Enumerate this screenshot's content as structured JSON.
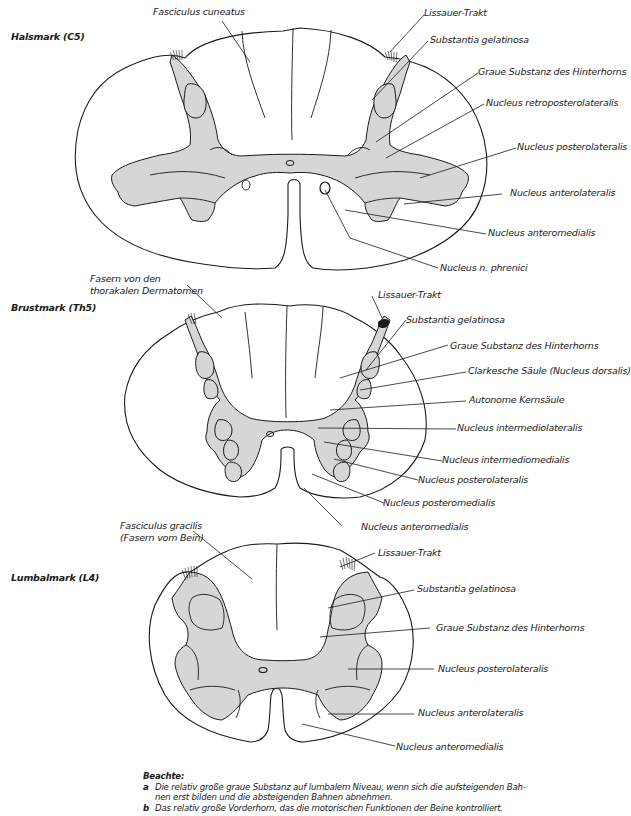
{
  "sections": [
    {
      "title": "Halsmark (C5)",
      "labels": {
        "fasciculus": "Fasciculus cuneatus",
        "lissauer": "Lissauer-Trakt",
        "gelatinosa": "Substantia gelatinosa",
        "graue": "Graue Substanz des Hinterhorns",
        "retropost": "Nucleus retroposterolateralis",
        "postlat": "Nucleus posterolateralis",
        "antlat": "Nucleus anterolateralis",
        "antmed": "Nucleus anteromedialis",
        "phrenici": "Nucleus n. phrenici"
      }
    },
    {
      "title": "Brustmark (Th5)",
      "labels": {
        "fasern_1": "Fasern von den",
        "fasern_2": "thorakalen Dermatomen",
        "lissauer": "Lissauer-Trakt",
        "gelatinosa": "Substantia gelatinosa",
        "graue": "Graue Substanz des Hinterhorns",
        "clarke": "Clarkesche Säule (Nucleus dorsalis)",
        "autonom": "Autonome Kernsäule",
        "intlat": "Nucleus intermediolateralis",
        "intmed": "Nucleus intermediomedialis",
        "postlat": "Nucleus posterolateralis",
        "postmed": "Nucleus posteromedialis",
        "antmed": "Nucleus anteromedialis"
      }
    },
    {
      "title": "Lumbalmark (L4)",
      "labels": {
        "fasciculus_1": "Fasciculus gracilis",
        "fasciculus_2": "(Fasern vom Bein)",
        "lissauer": "Lissauer-Trakt",
        "gelatinosa": "Substantia gelatinosa",
        "graue": "Graue Substanz des Hinterhorns",
        "postlat": "Nucleus posterolateralis",
        "antlat": "Nucleus anterolateralis",
        "antmed": "Nucleus anteromedialis"
      }
    }
  ],
  "note": {
    "heading": "Beachte:",
    "items": [
      {
        "key": "a",
        "text": "Die relativ große graue Substanz auf lumbalem Niveau, wenn sich die aufsteigenden Bah-",
        "text2": "nen erst bilden und die absteigenden Bahnen abnehmen."
      },
      {
        "key": "b",
        "text": "Das relativ große Vorderhorn, das die motorischen Funktionen der Beine kontrolliert."
      }
    ]
  },
  "colors": {
    "gray_matter": "#d6d6d6",
    "line": "#1a1a1a",
    "background": "#ffffff"
  }
}
